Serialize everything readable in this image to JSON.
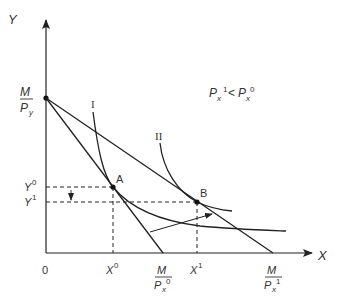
{
  "diagram": {
    "axes": {
      "y_label": "Y",
      "x_label": "X",
      "origin_label": "0"
    },
    "intercepts": {
      "y_intercept": {
        "numerator": "M",
        "denominator": "P",
        "sub": "y",
        "sup": ""
      },
      "x_intercept_0": {
        "numerator": "M",
        "denominator": "P",
        "sub": "x",
        "sup": "0"
      },
      "x_intercept_1": {
        "numerator": "M",
        "denominator": "P",
        "sub": "x",
        "sup": "1"
      }
    },
    "condition": {
      "left_base": "P",
      "left_sub": "x",
      "left_sup": "1",
      "operator": "<",
      "right_base": "P",
      "right_sub": "x",
      "right_sup": "0"
    },
    "curves": [
      {
        "id": "I",
        "label": "I"
      },
      {
        "id": "II",
        "label": "II"
      }
    ],
    "points": [
      {
        "id": "A",
        "label": "A"
      },
      {
        "id": "B",
        "label": "B"
      }
    ],
    "tick_labels": {
      "y0": {
        "base": "Y",
        "sup": "0"
      },
      "y1": {
        "base": "Y",
        "sup": "1"
      },
      "x0": {
        "base": "X",
        "sup": "0"
      },
      "x1": {
        "base": "X",
        "sup": "1"
      }
    },
    "colors": {
      "line": "#222222",
      "text": "#333333"
    }
  }
}
